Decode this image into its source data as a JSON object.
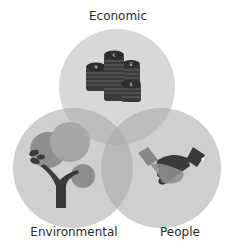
{
  "diagram": {
    "type": "venn",
    "sets": [
      {
        "id": "economic",
        "label": "Economic",
        "icon": "coin-stacks-icon",
        "symbols": [
          "€",
          "¥",
          "£",
          "$"
        ]
      },
      {
        "id": "environmental",
        "label": "Environmental",
        "icon": "tree-icon"
      },
      {
        "id": "people",
        "label": "People",
        "icon": "handshake-icon"
      }
    ],
    "colors": {
      "circle_fill": "#c8c8c8",
      "circle_opacity": "0.85",
      "icon_dark": "#3a3a3a",
      "icon_mid": "#8a8a8a",
      "text": "#2b2b2b"
    }
  }
}
